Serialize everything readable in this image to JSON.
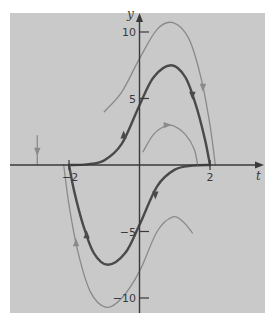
{
  "chart_data": {
    "type": "line",
    "title": "",
    "xlabel": "t",
    "ylabel": "y",
    "xlim": [
      -3.8,
      3.5
    ],
    "ylim": [
      -11.3,
      11.5
    ],
    "x_ticks": [
      -2,
      2
    ],
    "x_tick_labels": [
      "-2",
      "2"
    ],
    "y_ticks": [
      10,
      5,
      -5,
      -10
    ],
    "y_tick_labels": [
      "10",
      "5",
      "-5",
      "-10"
    ],
    "grid": false,
    "legend": null,
    "background": "#c9c9c9",
    "series": [
      {
        "name": "solution-upper-dark",
        "style": "dark",
        "color": "#4a4a4a",
        "points": [
          [
            -2.0,
            0.0
          ],
          [
            -1.5,
            0.05
          ],
          [
            -1.0,
            0.35
          ],
          [
            -0.5,
            1.6
          ],
          [
            0.0,
            4.5
          ],
          [
            0.4,
            6.6
          ],
          [
            0.9,
            7.5
          ],
          [
            1.3,
            6.6
          ],
          [
            1.6,
            4.5
          ],
          [
            1.85,
            2.0
          ],
          [
            2.0,
            0.0
          ]
        ],
        "arrows": [
          [
            -0.45,
            2.3,
            "up"
          ],
          [
            1.5,
            5.2,
            "down"
          ]
        ]
      },
      {
        "name": "solution-lower-dark",
        "style": "dark",
        "color": "#4a4a4a",
        "points": [
          [
            2.0,
            0.0
          ],
          [
            1.5,
            -0.05
          ],
          [
            1.0,
            -0.35
          ],
          [
            0.5,
            -1.6
          ],
          [
            0.0,
            -4.5
          ],
          [
            -0.4,
            -6.6
          ],
          [
            -0.9,
            -7.5
          ],
          [
            -1.3,
            -6.6
          ],
          [
            -1.6,
            -4.5
          ],
          [
            -1.85,
            -2.0
          ],
          [
            -2.0,
            0.0
          ]
        ],
        "arrows": [
          [
            0.45,
            -2.3,
            "down"
          ],
          [
            -1.5,
            -5.2,
            "up"
          ]
        ]
      },
      {
        "name": "solution-upper-light",
        "style": "light",
        "color": "#8a8a8a",
        "points": [
          [
            -1.0,
            4.0
          ],
          [
            -0.5,
            5.5
          ],
          [
            0.0,
            8.0
          ],
          [
            0.5,
            10.2
          ],
          [
            0.95,
            10.7
          ],
          [
            1.4,
            9.5
          ],
          [
            1.75,
            6.5
          ],
          [
            2.0,
            3.0
          ],
          [
            2.15,
            0.0
          ]
        ],
        "arrows": [
          [
            1.8,
            5.8,
            "down"
          ]
        ]
      },
      {
        "name": "solution-lower-light",
        "style": "light",
        "color": "#8a8a8a",
        "points": [
          [
            -2.15,
            0.0
          ],
          [
            -2.0,
            -3.0
          ],
          [
            -1.75,
            -6.5
          ],
          [
            -1.4,
            -9.5
          ],
          [
            -0.95,
            -10.7
          ],
          [
            -0.5,
            -10.0
          ],
          [
            0.0,
            -8.0
          ],
          [
            0.5,
            -5.0
          ],
          [
            0.95,
            -3.9
          ],
          [
            1.25,
            -4.3
          ],
          [
            1.5,
            -5.1
          ]
        ],
        "arrows": [
          [
            -1.8,
            -5.8,
            "up"
          ]
        ]
      },
      {
        "name": "solution-small-arc",
        "style": "light",
        "color": "#8a8a8a",
        "points": [
          [
            0.1,
            1.0
          ],
          [
            0.4,
            2.3
          ],
          [
            0.75,
            2.95
          ],
          [
            1.0,
            2.9
          ],
          [
            1.3,
            2.3
          ],
          [
            1.55,
            1.2
          ],
          [
            1.65,
            0.0
          ]
        ],
        "arrows": [
          [
            0.8,
            3.0,
            "right"
          ]
        ]
      },
      {
        "name": "equilibrium-arrow-left",
        "style": "light",
        "color": "#8a8a8a",
        "points": [
          [
            -2.9,
            2.2
          ],
          [
            -2.9,
            0.0
          ]
        ],
        "arrows": [
          [
            -2.9,
            1.0,
            "down"
          ]
        ]
      }
    ]
  }
}
